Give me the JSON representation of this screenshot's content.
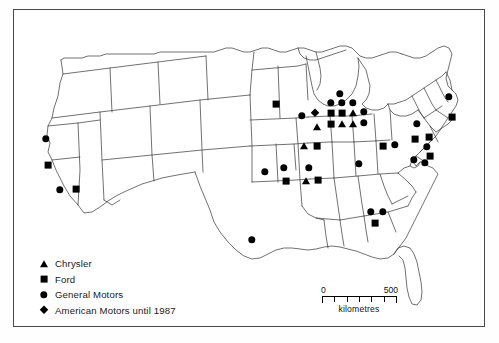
{
  "map": {
    "title": "Automobile assembly plants in the United States",
    "region": "United States",
    "border_color": "#4a4a4a",
    "outline_color": "#333333",
    "marker_color": "#000000"
  },
  "legend": {
    "items": [
      {
        "icon": "triangle-marker",
        "shape": "triangle",
        "label": "Chrysler"
      },
      {
        "icon": "square-marker",
        "shape": "square",
        "label": "Ford"
      },
      {
        "icon": "circle-marker",
        "shape": "circle",
        "label": "General Motors"
      },
      {
        "icon": "diamond-marker",
        "shape": "diamond",
        "label": "American Motors until 1987"
      }
    ]
  },
  "scale": {
    "min_label": "0",
    "max_label": "500",
    "units": "kilometres",
    "ticks": 6
  },
  "plants": [
    {
      "shape": "circle",
      "x": 46,
      "y": 139,
      "region": "Northern California"
    },
    {
      "shape": "square",
      "x": 48,
      "y": 165,
      "region": "Central California"
    },
    {
      "shape": "circle",
      "x": 60,
      "y": 190,
      "region": "Southern California"
    },
    {
      "shape": "square",
      "x": 76,
      "y": 189,
      "region": "Southern California"
    },
    {
      "shape": "circle",
      "x": 252,
      "y": 240,
      "region": "Texas"
    },
    {
      "shape": "circle",
      "x": 265,
      "y": 172,
      "region": "Kansas"
    },
    {
      "shape": "circle",
      "x": 284,
      "y": 168,
      "region": "Missouri"
    },
    {
      "shape": "square",
      "x": 286,
      "y": 181,
      "region": "Missouri"
    },
    {
      "shape": "circle",
      "x": 309,
      "y": 168,
      "region": "Missouri east"
    },
    {
      "shape": "triangle",
      "x": 306,
      "y": 181,
      "region": "Missouri east"
    },
    {
      "shape": "square",
      "x": 318,
      "y": 180,
      "region": "Missouri east"
    },
    {
      "shape": "square",
      "x": 276,
      "y": 104,
      "region": "Minnesota"
    },
    {
      "shape": "circle",
      "x": 302,
      "y": 116,
      "region": "Wisconsin"
    },
    {
      "shape": "diamond",
      "x": 315,
      "y": 113,
      "region": "Wisconsin"
    },
    {
      "shape": "triangle",
      "x": 317,
      "y": 127,
      "region": "Wisconsin south"
    },
    {
      "shape": "triangle",
      "x": 304,
      "y": 146,
      "region": "Illinois"
    },
    {
      "shape": "square",
      "x": 317,
      "y": 146,
      "region": "Illinois"
    },
    {
      "shape": "circle",
      "x": 340,
      "y": 94,
      "region": "Michigan north"
    },
    {
      "shape": "circle",
      "x": 331,
      "y": 103,
      "region": "Michigan"
    },
    {
      "shape": "circle",
      "x": 342,
      "y": 103,
      "region": "Michigan"
    },
    {
      "shape": "circle",
      "x": 353,
      "y": 103,
      "region": "Michigan"
    },
    {
      "shape": "square",
      "x": 331,
      "y": 113,
      "region": "Detroit area"
    },
    {
      "shape": "square",
      "x": 342,
      "y": 113,
      "region": "Detroit area"
    },
    {
      "shape": "triangle",
      "x": 353,
      "y": 113,
      "region": "Detroit area"
    },
    {
      "shape": "circle",
      "x": 364,
      "y": 112,
      "region": "Detroit area"
    },
    {
      "shape": "square",
      "x": 331,
      "y": 124,
      "region": "Detroit area"
    },
    {
      "shape": "triangle",
      "x": 342,
      "y": 124,
      "region": "Detroit area"
    },
    {
      "shape": "triangle",
      "x": 353,
      "y": 124,
      "region": "Detroit area"
    },
    {
      "shape": "circle",
      "x": 364,
      "y": 123,
      "region": "Detroit area"
    },
    {
      "shape": "circle",
      "x": 359,
      "y": 164,
      "region": "Indiana"
    },
    {
      "shape": "square",
      "x": 383,
      "y": 146,
      "region": "Ohio"
    },
    {
      "shape": "circle",
      "x": 395,
      "y": 145,
      "region": "Ohio"
    },
    {
      "shape": "circle",
      "x": 417,
      "y": 124,
      "region": "New York west"
    },
    {
      "shape": "square",
      "x": 415,
      "y": 139,
      "region": "Pennsylvania"
    },
    {
      "shape": "square",
      "x": 429,
      "y": 137,
      "region": "Pennsylvania"
    },
    {
      "shape": "circle",
      "x": 427,
      "y": 147,
      "region": "New Jersey"
    },
    {
      "shape": "square",
      "x": 430,
      "y": 156,
      "region": "New Jersey"
    },
    {
      "shape": "circle",
      "x": 414,
      "y": 160,
      "region": "Maryland"
    },
    {
      "shape": "circle",
      "x": 425,
      "y": 163,
      "region": "Delaware"
    },
    {
      "shape": "circle",
      "x": 449,
      "y": 97,
      "region": "New England"
    },
    {
      "shape": "square",
      "x": 452,
      "y": 117,
      "region": "New England"
    },
    {
      "shape": "circle",
      "x": 371,
      "y": 212,
      "region": "Georgia"
    },
    {
      "shape": "circle",
      "x": 383,
      "y": 212,
      "region": "Georgia"
    },
    {
      "shape": "square",
      "x": 375,
      "y": 223,
      "region": "Georgia"
    }
  ]
}
